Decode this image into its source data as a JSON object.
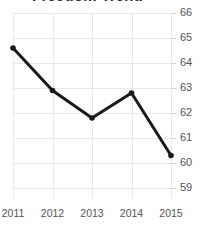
{
  "chart_data": {
    "type": "line",
    "title": "Freedom Trend",
    "xlabel": "",
    "ylabel": "",
    "categories": [
      "2011",
      "2012",
      "2013",
      "2014",
      "2015"
    ],
    "x": [
      2011,
      2012,
      2013,
      2014,
      2015
    ],
    "values": [
      64.6,
      62.9,
      61.8,
      62.8,
      60.3
    ],
    "series": [
      {
        "name": "Freedom Trend",
        "values": [
          64.6,
          62.9,
          61.8,
          62.8,
          60.3
        ]
      }
    ],
    "ylim": [
      58.5,
      66.0
    ],
    "yticks": [
      66,
      65,
      64,
      63,
      62,
      61,
      60,
      59
    ],
    "ytick_labels": [
      "66",
      "65",
      "64",
      "63",
      "62",
      "61",
      "60",
      "59"
    ],
    "xticks": [
      2011,
      2012,
      2013,
      2014,
      2015
    ],
    "xtick_labels": [
      "2011",
      "2012",
      "2013",
      "2014",
      "2015"
    ],
    "grid": true,
    "grid_axis": "both",
    "legend": false,
    "legend_position": "none",
    "y_axis_position": "right",
    "marker": "circle",
    "line_color": "#1a1a1a",
    "marker_color": "#1a1a1a",
    "grid_color": "#e8e8e8",
    "tick_label_color": "#555555",
    "title_color": "#2b2b2b",
    "background_color": "#ffffff"
  }
}
